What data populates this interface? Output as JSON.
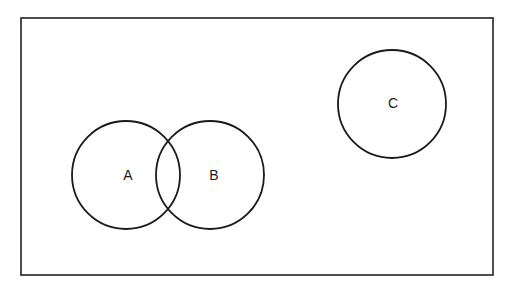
{
  "diagram": {
    "type": "venn",
    "universe": {
      "x": 21,
      "y": 18,
      "width": 472,
      "height": 257,
      "stroke": "#222222"
    },
    "sets": [
      {
        "label": "A",
        "cx": 126,
        "cy": 175,
        "r": 54
      },
      {
        "label": "B",
        "cx": 210,
        "cy": 175,
        "r": 54
      },
      {
        "label": "C",
        "cx": 392,
        "cy": 104,
        "r": 54
      }
    ],
    "relationships": {
      "A_B": "overlapping",
      "A_C": "disjoint",
      "B_C": "disjoint"
    },
    "stroke_color": "#222222",
    "background": "#ffffff"
  }
}
